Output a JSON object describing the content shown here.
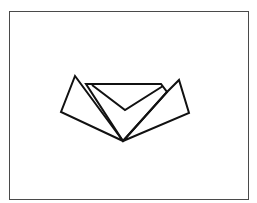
{
  "diagram": {
    "frame": {
      "x": 9,
      "y": 11,
      "width": 239,
      "height": 188,
      "stroke": "#4a4a4a"
    },
    "stroke_color": "#111111",
    "stroke_width": 2,
    "shapes": [
      {
        "name": "left-panel",
        "points": "75,76 61,112 123,141"
      },
      {
        "name": "center-panel",
        "points": "86,84 161,84 167,92 123,141"
      },
      {
        "name": "center-notch",
        "points": "92,85 125,110 163,86"
      },
      {
        "name": "right-panel",
        "points": "167,92 179,80 189,113 123,141"
      }
    ]
  }
}
